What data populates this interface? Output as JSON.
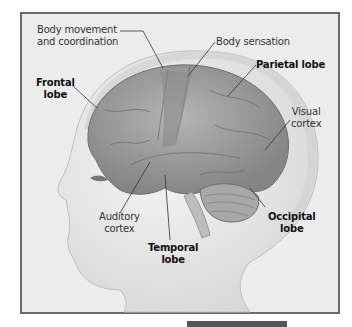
{
  "figure": {
    "colors": {
      "frame_border": "#6b6b6b",
      "background": "#ececec",
      "brain": "#9a9a9a",
      "text": "#111111"
    },
    "labels": [
      {
        "id": "body_movement",
        "text": "Body movement\nand coordination",
        "line1": "Body movement",
        "line2": "and coordination",
        "bold": false
      },
      {
        "id": "body_sensation",
        "text": "Body sensation",
        "bold": false
      },
      {
        "id": "frontal_lobe",
        "line1": "Frontal",
        "line2": "lobe",
        "bold": true
      },
      {
        "id": "parietal_lobe",
        "text": "Parietal lobe",
        "bold": true
      },
      {
        "id": "visual_cortex",
        "line1": "Visual",
        "line2": "cortex",
        "bold": false
      },
      {
        "id": "auditory_cortex",
        "line1": "Auditory",
        "line2": "cortex",
        "bold": false
      },
      {
        "id": "temporal_lobe",
        "line1": "Temporal",
        "line2": "lobe",
        "bold": true
      },
      {
        "id": "occipital_lobe",
        "line1": "Occipital",
        "line2": "lobe",
        "bold": true
      }
    ]
  }
}
